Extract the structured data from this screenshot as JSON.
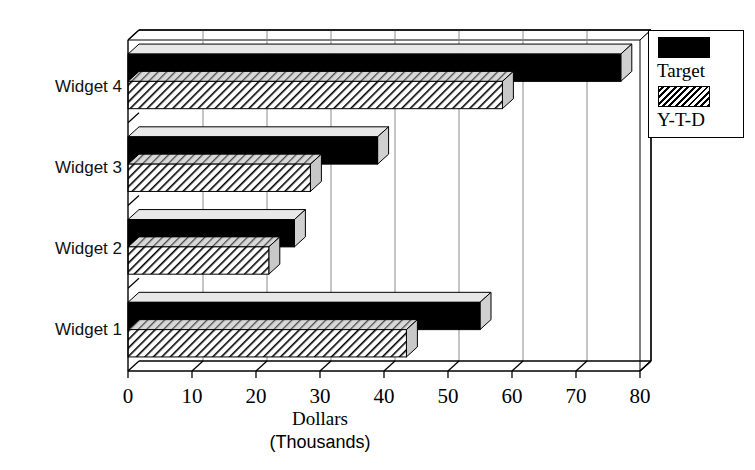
{
  "chart_data": {
    "type": "bar",
    "orientation": "horizontal",
    "title": "",
    "xlabel": "Dollars",
    "xlabel_sub": "(Thousands)",
    "ylabel": "",
    "categories": [
      "Widget 1",
      "Widget 2",
      "Widget 3",
      "Widget 4"
    ],
    "series": [
      {
        "name": "Target",
        "values": [
          55,
          26,
          39,
          77
        ],
        "fill": "solid-black",
        "color": "#000000"
      },
      {
        "name": "Y-T-D",
        "values": [
          43.5,
          22,
          28.5,
          58.5
        ],
        "fill": "diagonal-hatch",
        "color": "#000000"
      }
    ],
    "xlim": [
      0,
      80
    ],
    "xticks": [
      0,
      10,
      20,
      30,
      40,
      50,
      60,
      70,
      80
    ],
    "xtick_labels": [
      "0",
      "10",
      "20",
      "30",
      "40",
      "50",
      "60",
      "70",
      "80"
    ],
    "grid": "vertical",
    "legend_position": "top-right",
    "style": "3d-bar",
    "background": "#ffffff",
    "axis_color": "#000000",
    "grid_color": "#999999"
  },
  "legend": {
    "entries": [
      {
        "label": "Target",
        "swatch": "solid-black"
      },
      {
        "label": "Y-T-D",
        "swatch": "diagonal-hatch"
      }
    ]
  },
  "axes": {
    "x_title": "Dollars",
    "x_title_sub": "(Thousands)",
    "x_tick_labels": [
      "0",
      "10",
      "20",
      "30",
      "40",
      "50",
      "60",
      "70",
      "80"
    ],
    "y_tick_labels": [
      "Widget 4",
      "Widget 3",
      "Widget 2",
      "Widget 1"
    ]
  }
}
